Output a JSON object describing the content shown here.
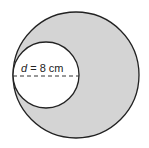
{
  "diagram": {
    "small_circle": {
      "label_var": "d",
      "label_rest": " = 8 cm",
      "diameter_value": 8,
      "diameter_unit": "cm"
    },
    "colors": {
      "shaded_fill": "#d4d4d4",
      "outline": "#222222",
      "small_fill": "#ffffff"
    }
  }
}
